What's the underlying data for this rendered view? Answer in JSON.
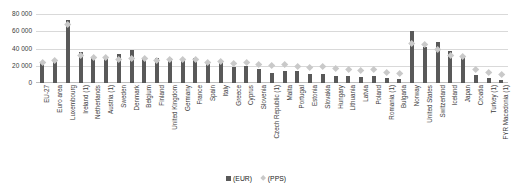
{
  "chart_data": {
    "type": "bar",
    "title": "",
    "subtitle": "",
    "xlabel": "",
    "ylabel": "",
    "ylim": [
      0,
      80000
    ],
    "yticks": [
      "0",
      "20 000",
      "40 000",
      "60 000",
      "80 000"
    ],
    "ytick_values": [
      0,
      20000,
      40000,
      60000,
      80000
    ],
    "grid": true,
    "legend_position": "bottom",
    "legend": [
      {
        "label": "(EUR)",
        "marker": "square",
        "color": "#595959"
      },
      {
        "label": "(PPS)",
        "marker": "diamond",
        "color": "#c9c9c9"
      }
    ],
    "categories": [
      "EU-27",
      "Euro area",
      "Luxembourg",
      "Ireland (1)",
      "Netherlands",
      "Austria (1)",
      "Sweden",
      "Denmark",
      "Belgium",
      "Finland",
      "United Kingdom",
      "Germany",
      "France",
      "Spain",
      "Italy",
      "Greece",
      "Cyprus",
      "Slovenia",
      "Czech Republic (1)",
      "Malta",
      "Portugal",
      "Estonia",
      "Slovakia",
      "Hungary",
      "Lithuania",
      "Latvia",
      "Poland",
      "Romania (1)",
      "Bulgaria",
      "Norway",
      "United States",
      "Switzerland",
      "Iceland",
      "Japan",
      "Croatia",
      "Turkey (1)",
      "FYR Macedonia (1)"
    ],
    "series": [
      {
        "name": "(EUR)",
        "values": [
          23500,
          26000,
          73000,
          36500,
          30500,
          30000,
          34000,
          38000,
          29500,
          29000,
          28500,
          28000,
          28500,
          22000,
          24500,
          18000,
          19500,
          16500,
          12000,
          13500,
          14500,
          10500,
          11000,
          8500,
          8000,
          7500,
          8500,
          5500,
          4500,
          60000,
          42000,
          48000,
          37000,
          30000,
          9500,
          6000,
          4000
        ]
      },
      {
        "name": "(PPS)",
        "values": [
          23500,
          25500,
          68000,
          31500,
          29000,
          29500,
          27500,
          28000,
          28000,
          25500,
          27000,
          27500,
          26500,
          24000,
          24500,
          22500,
          24000,
          21000,
          20000,
          21000,
          19500,
          17500,
          18500,
          16500,
          15500,
          14000,
          16000,
          12000,
          11000,
          46000,
          44000,
          39000,
          32000,
          30000,
          15500,
          12000,
          10000
        ]
      }
    ]
  }
}
